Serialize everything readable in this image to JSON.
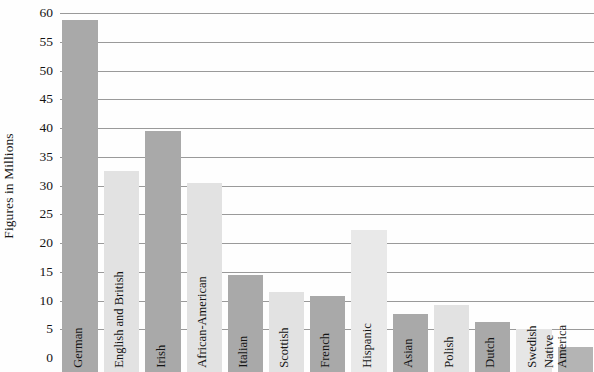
{
  "chart_data": {
    "type": "bar",
    "title": "",
    "subtitle": "",
    "xlabel": "",
    "ylabel": "Figures in Millions",
    "ylim": [
      0,
      60
    ],
    "ytick_step": 5,
    "yticks": [
      60,
      55,
      50,
      45,
      40,
      35,
      30,
      25,
      20,
      15,
      10,
      5,
      0
    ],
    "grid": true,
    "legend": "none",
    "categories": [
      "German",
      "English and British",
      "Irish",
      "African-American",
      "Italian",
      "Scottish",
      "French",
      "Hispanic",
      "Asian",
      "Polish",
      "Dutch",
      "Swedish",
      "Native America"
    ],
    "values": [
      58.8,
      32.6,
      39.4,
      30.4,
      14.5,
      11.5,
      10.8,
      22.2,
      7.7,
      9.3,
      6.3,
      5.0,
      2.0
    ],
    "bar_colors": [
      "#a9a9a9",
      "#e2e2e2",
      "#a9a9a9",
      "#e2e2e2",
      "#a9a9a9",
      "#e2e2e2",
      "#a9a9a9",
      "#e9e9e9",
      "#a9a9a9",
      "#e2e2e2",
      "#a9a9a9",
      "#e6e6e6",
      "#b4b4b4"
    ],
    "label_lines": [
      [
        "German"
      ],
      [
        "English and British"
      ],
      [
        "Irish"
      ],
      [
        "African-American"
      ],
      [
        "Italian"
      ],
      [
        "Scottish"
      ],
      [
        "French"
      ],
      [
        "Hispanic"
      ],
      [
        "Asian"
      ],
      [
        "Polish"
      ],
      [
        "Dutch"
      ],
      [
        "Swedish"
      ],
      [
        "Native",
        "America"
      ]
    ]
  },
  "axis": {
    "y_title": "Figures in Millions"
  },
  "colors": {
    "gridline": "#9a9a9a",
    "text": "#141414",
    "background": "#ffffff",
    "bar_dark": "#a9a9a9",
    "bar_light": "#e2e2e2"
  }
}
